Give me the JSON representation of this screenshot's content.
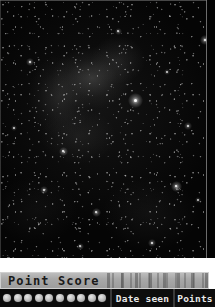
{
  "sky_image": {
    "name": "night-sky-starfield",
    "alt": "Dark night sky starfield with faint nebulosity and scattered stars",
    "background_color": "#050505",
    "bright_stars": [
      {
        "x": 135,
        "y": 100,
        "size": 3.0,
        "brightness": 1.0
      },
      {
        "x": 176,
        "y": 186,
        "size": 2.2,
        "brightness": 0.9
      },
      {
        "x": 205,
        "y": 40,
        "size": 2.0,
        "brightness": 0.85
      },
      {
        "x": 63,
        "y": 151,
        "size": 1.8,
        "brightness": 0.8
      },
      {
        "x": 96,
        "y": 212,
        "size": 1.8,
        "brightness": 0.75
      },
      {
        "x": 30,
        "y": 62,
        "size": 1.6,
        "brightness": 0.7
      },
      {
        "x": 152,
        "y": 243,
        "size": 1.6,
        "brightness": 0.7
      },
      {
        "x": 188,
        "y": 126,
        "size": 1.5,
        "brightness": 0.65
      },
      {
        "x": 44,
        "y": 190,
        "size": 1.5,
        "brightness": 0.65
      },
      {
        "x": 118,
        "y": 31,
        "size": 1.4,
        "brightness": 0.6
      },
      {
        "x": 80,
        "y": 246,
        "size": 1.4,
        "brightness": 0.6
      },
      {
        "x": 167,
        "y": 72,
        "size": 1.3,
        "brightness": 0.55
      },
      {
        "x": 14,
        "y": 128,
        "size": 1.3,
        "brightness": 0.55
      },
      {
        "x": 198,
        "y": 200,
        "size": 1.3,
        "brightness": 0.5
      }
    ]
  },
  "point_score_panel": {
    "title": "Point Score",
    "title_color": "#1a1a1a",
    "bar_color": "#a8a8a8"
  },
  "table": {
    "row_background": "#0d0d0d",
    "score_dots": [
      {
        "filled": true
      },
      {
        "filled": true
      },
      {
        "filled": true
      },
      {
        "filled": true
      },
      {
        "filled": true
      },
      {
        "filled": true
      },
      {
        "filled": true
      },
      {
        "filled": true
      },
      {
        "filled": true
      },
      {
        "filled": true
      }
    ],
    "columns": [
      {
        "key": "date_seen",
        "label": "Date seen"
      },
      {
        "key": "points",
        "label": "Points"
      }
    ]
  }
}
